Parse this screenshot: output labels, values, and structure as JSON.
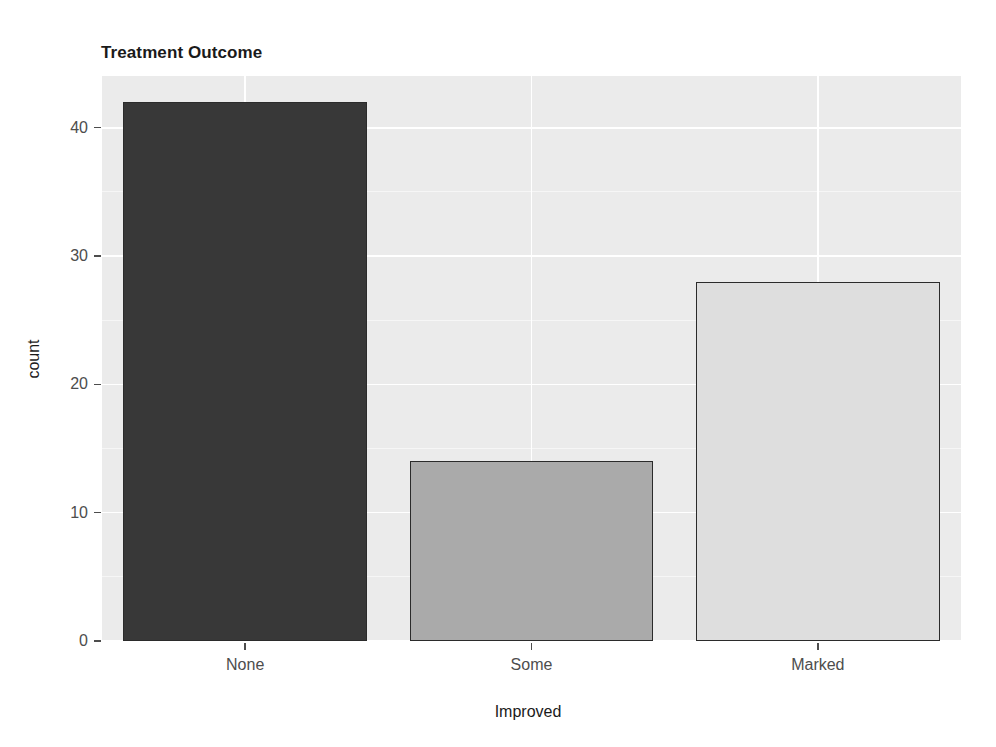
{
  "chart_data": {
    "type": "bar",
    "title": "Treatment Outcome",
    "xlabel": "Improved",
    "ylabel": "count",
    "categories": [
      "None",
      "Some",
      "Marked"
    ],
    "values": [
      42,
      14,
      28
    ],
    "bar_colors": [
      "#383838",
      "#aaaaaa",
      "#dedede"
    ],
    "bar_outline_color": "#2b2b2b",
    "ylim": [
      0,
      44
    ],
    "ytick_labels": [
      "0",
      "10",
      "20",
      "30",
      "40"
    ],
    "ytick_values": [
      0,
      10,
      20,
      30,
      40
    ],
    "grid": true,
    "grid_major_color": "#ffffff",
    "panel_background": "#ebebeb",
    "legend": "none",
    "series": [
      {
        "name": "count",
        "points": [
          {
            "category": "None",
            "value": 42
          },
          {
            "category": "Some",
            "value": 14
          },
          {
            "category": "Marked",
            "value": 28
          }
        ]
      }
    ]
  },
  "title": {
    "text": "Treatment Outcome"
  },
  "axes": {
    "x": {
      "title": "Improved",
      "ticks": [
        {
          "label": "None"
        },
        {
          "label": "Some"
        },
        {
          "label": "Marked"
        }
      ]
    },
    "y": {
      "title": "count",
      "ticks": [
        {
          "label": "40"
        },
        {
          "label": "30"
        },
        {
          "label": "20"
        },
        {
          "label": "10"
        },
        {
          "label": "0"
        }
      ]
    }
  }
}
